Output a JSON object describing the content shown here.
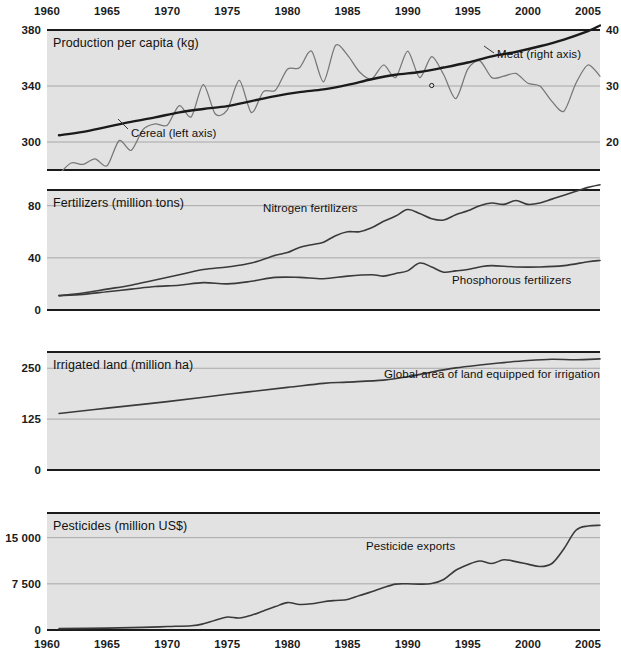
{
  "figure": {
    "background": "#ffffff",
    "panel_background": "#e2e2e2",
    "grid_color": "#9a9a9a",
    "ink_color": "#1b1b1b",
    "thin_series_color": "#767676"
  },
  "x_axis": {
    "ticks": [
      "1960",
      "1965",
      "1970",
      "1975",
      "1980",
      "1985",
      "1990",
      "1995",
      "2000",
      "2005"
    ],
    "min": 1960,
    "max": 2006
  },
  "chart_data": [
    {
      "id": "production-per-capita",
      "type": "line",
      "title": "Production per capita (kg)",
      "xlabel": "",
      "ylabel": "Production per capita (kg)",
      "ylim": [
        280,
        380
      ],
      "y_ticks": [
        "300",
        "340",
        "380"
      ],
      "y_tick_values": [
        300,
        340,
        380
      ],
      "y2_ticks": [
        "20",
        "30",
        "40"
      ],
      "y2_tick_values": [
        20,
        30,
        40
      ],
      "ylim_right": [
        15,
        40
      ],
      "grid": true,
      "legend_position": "inline-annotations",
      "series": [
        {
          "name": "Cereal (left axis)",
          "axis": "left",
          "style": "thin",
          "annotation": "Cereal (left axis)",
          "x": [
            1961,
            1962,
            1963,
            1964,
            1965,
            1966,
            1967,
            1968,
            1969,
            1970,
            1971,
            1972,
            1973,
            1974,
            1975,
            1976,
            1977,
            1978,
            1979,
            1980,
            1981,
            1982,
            1983,
            1984,
            1985,
            1986,
            1987,
            1988,
            1989,
            1990,
            1991,
            1992,
            1993,
            1994,
            1995,
            1996,
            1997,
            1998,
            1999,
            2000,
            2001,
            2002,
            2003,
            2004,
            2005,
            2006
          ],
          "values": [
            277,
            285,
            284,
            288,
            283,
            301,
            294,
            309,
            313,
            312,
            326,
            318,
            341,
            320,
            323,
            344,
            321,
            336,
            337,
            352,
            353,
            365,
            343,
            369,
            362,
            350,
            345,
            355,
            346,
            365,
            346,
            361,
            348,
            331,
            352,
            358,
            346,
            347,
            349,
            342,
            340,
            329,
            322,
            342,
            355,
            347
          ]
        },
        {
          "name": "Meat (right axis)",
          "axis": "right",
          "style": "thick",
          "annotation": "Meat (right axis)",
          "x": [
            1961,
            1963,
            1965,
            1967,
            1969,
            1971,
            1973,
            1975,
            1977,
            1979,
            1981,
            1983,
            1985,
            1987,
            1989,
            1991,
            1993,
            1995,
            1997,
            1999,
            2001,
            2003,
            2005,
            2006
          ],
          "values": [
            21.2,
            21.8,
            22.7,
            23.6,
            24.4,
            25.3,
            25.9,
            26.4,
            27.3,
            28.2,
            28.9,
            29.4,
            30.2,
            31.2,
            32.0,
            32.5,
            33.3,
            34.2,
            35.3,
            36.1,
            37.1,
            38.3,
            39.8,
            40.8
          ]
        }
      ]
    },
    {
      "id": "fertilizers",
      "type": "line",
      "title": "Fertilizers (million tons)",
      "ylabel": "Fertilizers (million tons)",
      "ylim": [
        0,
        92
      ],
      "y_ticks": [
        "0",
        "40",
        "80"
      ],
      "y_tick_values": [
        0,
        40,
        80
      ],
      "grid": true,
      "series": [
        {
          "name": "Nitrogen fertilizers",
          "style": "mid",
          "annotation": "Nitrogen fertilizers",
          "x": [
            1961,
            1963,
            1965,
            1967,
            1969,
            1971,
            1973,
            1975,
            1977,
            1979,
            1980,
            1981,
            1982,
            1983,
            1984,
            1985,
            1986,
            1987,
            1988,
            1989,
            1990,
            1991,
            1992,
            1993,
            1994,
            1995,
            1996,
            1997,
            1998,
            1999,
            2000,
            2001,
            2002,
            2003,
            2004,
            2005,
            2006
          ],
          "values": [
            11,
            13,
            16,
            19,
            23,
            27,
            31,
            33,
            36,
            42,
            44,
            48,
            50,
            52,
            57,
            60,
            60,
            63,
            68,
            72,
            77,
            74,
            70,
            69,
            73,
            76,
            80,
            82,
            81,
            84,
            81,
            82,
            85,
            88,
            91,
            94,
            96
          ]
        },
        {
          "name": "Phosphorous fertilizers",
          "style": "mid",
          "annotation": "Phosphorous fertilizers",
          "x": [
            1961,
            1963,
            1965,
            1967,
            1969,
            1971,
            1973,
            1975,
            1977,
            1979,
            1981,
            1983,
            1985,
            1987,
            1988,
            1989,
            1990,
            1991,
            1992,
            1993,
            1994,
            1995,
            1996,
            1997,
            1999,
            2001,
            2003,
            2005,
            2006
          ],
          "values": [
            11,
            12,
            14,
            16,
            18,
            19,
            21,
            20,
            22,
            25,
            25,
            24,
            26,
            27,
            26,
            28,
            30,
            36,
            33,
            29,
            30,
            31,
            33,
            34,
            33,
            33,
            34,
            37,
            38
          ]
        }
      ]
    },
    {
      "id": "irrigated-land",
      "type": "line",
      "title": "Irrigated land (million ha)",
      "ylabel": "Irrigated land (million ha)",
      "ylim": [
        0,
        290
      ],
      "y_ticks": [
        "0",
        "125",
        "250"
      ],
      "y_tick_values": [
        0,
        125,
        250
      ],
      "grid": true,
      "series": [
        {
          "name": "Global area of land equipped for irrigation",
          "style": "mid",
          "annotation": "Global area of land equipped for irrigation",
          "x": [
            1961,
            1965,
            1970,
            1975,
            1980,
            1983,
            1985,
            1988,
            1990,
            1992,
            1994,
            1996,
            1998,
            2000,
            2002,
            2004,
            2006
          ],
          "values": [
            139,
            152,
            168,
            186,
            203,
            213,
            216,
            221,
            229,
            241,
            251,
            258,
            264,
            269,
            272,
            271,
            273
          ]
        }
      ]
    },
    {
      "id": "pesticides",
      "type": "line",
      "title": "Pesticides (million US$)",
      "ylabel": "Pesticides (million US$)",
      "ylim": [
        0,
        19000
      ],
      "y_ticks": [
        "0",
        "7 500",
        "15 000"
      ],
      "y_tick_values": [
        0,
        7500,
        15000
      ],
      "grid": true,
      "series": [
        {
          "name": "Pesticide exports",
          "style": "mid",
          "annotation": "Pesticide exports",
          "x": [
            1961,
            1965,
            1968,
            1970,
            1972,
            1973,
            1974,
            1975,
            1976,
            1977,
            1978,
            1979,
            1980,
            1981,
            1982,
            1983,
            1984,
            1985,
            1986,
            1987,
            1988,
            1989,
            1990,
            1991,
            1992,
            1993,
            1994,
            1995,
            1996,
            1997,
            1998,
            1999,
            2000,
            2001,
            2002,
            2003,
            2004,
            2005,
            2006
          ],
          "values": [
            230,
            300,
            420,
            560,
            700,
            1000,
            1600,
            2100,
            1950,
            2400,
            3100,
            3800,
            4450,
            4150,
            4250,
            4600,
            4800,
            4950,
            5600,
            6200,
            6900,
            7450,
            7500,
            7450,
            7550,
            8200,
            9700,
            10600,
            11200,
            10800,
            11400,
            11100,
            10700,
            10300,
            10800,
            13200,
            16200,
            16900,
            17000
          ]
        }
      ]
    }
  ]
}
